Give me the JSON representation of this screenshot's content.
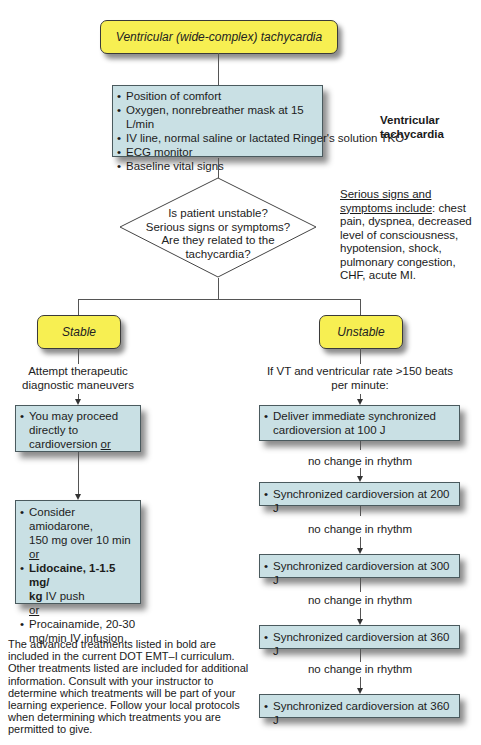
{
  "title": "Ventricular (wide-complex) tachycardia",
  "side_label": "Ventricular tachycardia",
  "initial_care": {
    "items": [
      "Position of comfort",
      "Oxygen, nonrebreather mask at 15 L/min",
      "IV line, normal saline or lactated Ringer's solution TKO",
      "ECG monitor",
      "Baseline vital signs"
    ]
  },
  "decision": {
    "lines": [
      "Is patient unstable?",
      "Serious signs or symptoms?",
      "Are they related to the",
      "tachycardia?"
    ]
  },
  "serious_signs": {
    "heading_line1": "Serious signs and",
    "heading_line2": "symptoms include",
    "text_after_heading": ": chest",
    "lines": [
      "pain, dyspnea, decreased",
      "level of consciousness,",
      "hypotension, shock,",
      "pulmonary congestion,",
      "CHF, acute MI."
    ]
  },
  "stable": {
    "label": "Stable",
    "maneuvers_line1": "Attempt therapeutic",
    "maneuvers_line2": "diagnostic maneuvers",
    "box1": {
      "line1": "You may proceed",
      "line2": "directly to",
      "line3_text": "cardioversion ",
      "line3_or": "or"
    },
    "box2": {
      "amiodarone_line1": "Consider amiodarone,",
      "amiodarone_line2": "150 mg over 10 min",
      "or1": "or",
      "lidocaine_bold1": "Lidocaine, 1-1.5 mg/",
      "lidocaine_bold2": "kg",
      "lidocaine_rest": " IV push",
      "or2": "or",
      "procainamide_line1": "Procainamide, 20-30",
      "procainamide_line2": "mg/min IV infusion"
    }
  },
  "unstable": {
    "label": "Unstable",
    "condition_line1": "If VT and ventricular rate >150 beats",
    "condition_line2": "per minute:",
    "steps": [
      {
        "line1": "Deliver immediate synchronized",
        "line2": "cardioversion at 100 J"
      },
      {
        "line1": "Synchronized cardioversion at 200 J"
      },
      {
        "line1": "Synchronized cardioversion at 300 J"
      },
      {
        "line1": "Synchronized cardioversion at 360 J"
      },
      {
        "line1": "Synchronized cardioversion at 360 J"
      }
    ],
    "transition_label": "no change in rhythm"
  },
  "footnote": {
    "lines": [
      "The advanced treatments listed in bold are",
      "included in the current DOT EMT–I curriculum.",
      "Other treatments listed are included for additional",
      "information. Consult with your instructor to",
      "determine which treatments will be part of your",
      "learning experience. Follow your local protocols",
      "when determining which treatments you are",
      "permitted to give."
    ]
  },
  "colors": {
    "yellow_box": "#f7ef52",
    "blue_box": "#c9e0e4",
    "line": "#555555"
  }
}
